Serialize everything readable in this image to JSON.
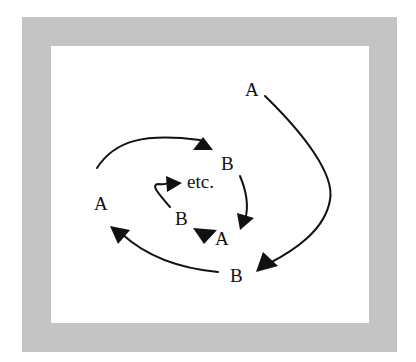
{
  "diagram": {
    "type": "cycle-spiral",
    "colors": {
      "frame": "#c4c4c4",
      "background": "#ffffff",
      "ink": "#111111"
    },
    "labels": {
      "a_outer": "A",
      "b_outer": "B",
      "a_middle": "A",
      "b_middle": "B",
      "a_inner": "A",
      "b_inner": "B",
      "etc": "etc."
    },
    "edges": [
      {
        "from": "A (top right)",
        "to": "B (bottom)"
      },
      {
        "from": "B (bottom)",
        "to": "A (left)"
      },
      {
        "from": "A (left)",
        "to": "B (upper middle)"
      },
      {
        "from": "B (upper middle)",
        "to": "A (center)"
      },
      {
        "from": "A (center)",
        "to": "B (center)"
      },
      {
        "from": "B (center)",
        "to": "etc."
      }
    ]
  }
}
